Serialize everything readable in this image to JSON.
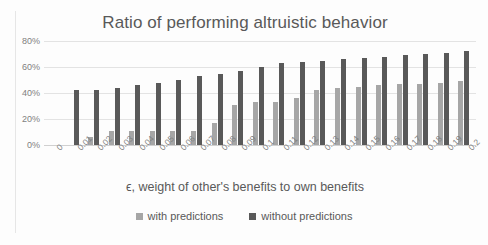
{
  "chart_data": {
    "type": "bar",
    "title": "Ratio of performing altruistic behavior",
    "xlabel": "ϵ, weight of other's benefits to own benefits",
    "ylabel": "",
    "ylim": [
      0,
      80
    ],
    "ytick_labels": [
      "80%",
      "60%",
      "40%",
      "20%",
      "0%"
    ],
    "ytick_values": [
      80,
      60,
      40,
      20,
      0
    ],
    "grid": true,
    "legend_position": "bottom",
    "categories": [
      "0",
      "0.01",
      "0.02",
      "0.03",
      "0.04",
      "0.05",
      "0.06",
      "0.07",
      "0.08",
      "0.09",
      "0.1",
      "0.11",
      "0.12",
      "0.13",
      "0.14",
      "0.15",
      "0.16",
      "0.17",
      "0.18",
      "0.19",
      "0.2"
    ],
    "series": [
      {
        "name": "with predictions",
        "color": "#a6a6a6",
        "values": [
          0,
          0,
          6,
          11,
          11,
          11,
          11,
          11,
          17,
          31,
          33,
          33,
          36,
          42,
          44,
          45,
          46,
          47,
          47,
          48,
          49
        ]
      },
      {
        "name": "without predictions",
        "color": "#595959",
        "values": [
          0,
          42,
          42,
          44,
          46,
          48,
          50,
          53,
          55,
          57,
          60,
          63,
          64,
          65,
          66,
          67,
          68,
          69,
          70,
          71,
          72
        ]
      }
    ]
  },
  "colors": {
    "series_1": "#a6a6a6",
    "series_2": "#595959",
    "gridline": "#e3e3e3",
    "text": "#595959",
    "tick_text": "#7f7f7f",
    "background": "#ffffff"
  }
}
